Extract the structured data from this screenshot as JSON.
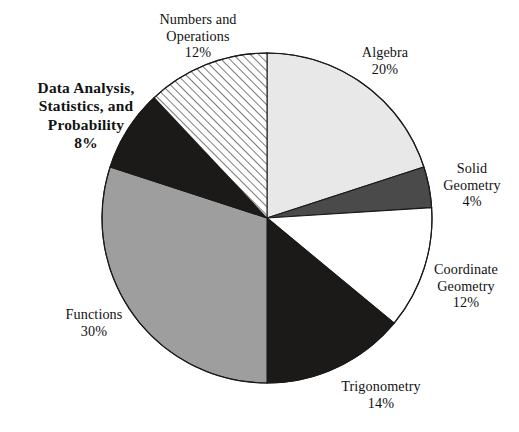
{
  "chart_data": {
    "type": "pie",
    "title": "",
    "subtitle": "",
    "xlabel": "",
    "ylabel": "",
    "legend_position": "none",
    "grid": false,
    "units": "percent",
    "total": 100,
    "start_angle_deg": 0,
    "direction": "clockwise",
    "categories": [
      "Algebra",
      "Solid Geometry",
      "Coordinate Geometry",
      "Trigonometry",
      "Functions",
      "Data Analysis, Statistics, and Probability",
      "Numbers and Operations"
    ],
    "values": [
      20,
      4,
      12,
      14,
      30,
      8,
      12
    ],
    "slices": [
      {
        "id": "algebra",
        "label": "Algebra",
        "label_lines": [
          "Algebra"
        ],
        "value": 20,
        "percent_text": "20%",
        "fill": "#e8e8e8",
        "pattern": "solid",
        "stroke": "#1a1a1a",
        "emphasis": false
      },
      {
        "id": "solid-geometry",
        "label": "Solid Geometry",
        "label_lines": [
          "Solid",
          "Geometry"
        ],
        "value": 4,
        "percent_text": "4%",
        "fill": "#4a4a4a",
        "pattern": "solid",
        "stroke": "#1a1a1a",
        "emphasis": false
      },
      {
        "id": "coordinate-geometry",
        "label": "Coordinate Geometry",
        "label_lines": [
          "Coordinate",
          "Geometry"
        ],
        "value": 12,
        "percent_text": "12%",
        "fill": "#ffffff",
        "pattern": "solid",
        "stroke": "#1a1a1a",
        "emphasis": false
      },
      {
        "id": "trigonometry",
        "label": "Trigonometry",
        "label_lines": [
          "Trigonometry"
        ],
        "value": 14,
        "percent_text": "14%",
        "fill": "#1c1a18",
        "pattern": "solid",
        "stroke": "#1a1a1a",
        "emphasis": false
      },
      {
        "id": "functions",
        "label": "Functions",
        "label_lines": [
          "Functions"
        ],
        "value": 30,
        "percent_text": "30%",
        "fill": "#9e9e9e",
        "pattern": "solid",
        "stroke": "#1a1a1a",
        "emphasis": false
      },
      {
        "id": "data-analysis",
        "label": "Data Analysis, Statistics, and Probability",
        "label_lines": [
          "Data Analysis,",
          "Statistics, and",
          "Probability"
        ],
        "value": 8,
        "percent_text": "8%",
        "fill": "#1c1a18",
        "pattern": "solid",
        "stroke": "#1a1a1a",
        "emphasis": true
      },
      {
        "id": "numbers-and-operations",
        "label": "Numbers and Operations",
        "label_lines": [
          "Numbers and",
          "Operations"
        ],
        "value": 12,
        "percent_text": "12%",
        "fill": "#ffffff",
        "pattern": "diagonal-hatch",
        "stroke": "#1a1a1a",
        "emphasis": false
      }
    ],
    "geometry": {
      "center_x": 267,
      "center_y": 218,
      "radius": 165
    },
    "colors": {
      "outline": "#1a1a1a",
      "background": "#ffffff",
      "text": "#121212",
      "light_gray": "#e8e8e8",
      "mid_gray": "#9e9e9e",
      "dark_gray": "#4a4a4a",
      "black": "#1c1a18"
    }
  }
}
